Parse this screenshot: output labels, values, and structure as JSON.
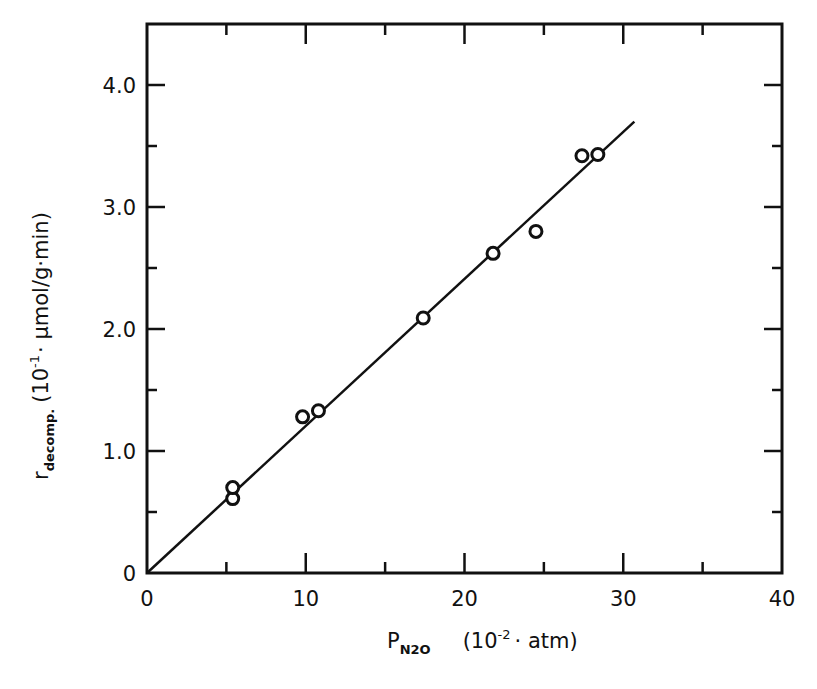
{
  "chart_data": {
    "type": "scatter",
    "title": "",
    "xlabel": "P_N2O (10^-2 · atm)",
    "ylabel": "r_decomp. (10^-1 · µmol/g·min)",
    "xlabel_parts": {
      "symbol": "P",
      "subscript": "N2O",
      "unit_pre": "(10",
      "unit_sup": "-2",
      "unit_post": "· atm)"
    },
    "ylabel_parts": {
      "symbol": "r",
      "subscript": "decomp.",
      "unit_pre": "(10",
      "unit_sup": "-1",
      "unit_post": "· µmol/g·min)"
    },
    "xlim": [
      0,
      40
    ],
    "ylim": [
      0,
      4.5
    ],
    "x_ticks": [
      0,
      10,
      20,
      30,
      40
    ],
    "x_tick_labels": [
      "0",
      "10",
      "20",
      "30",
      "40"
    ],
    "x_minor_ticks": [
      5,
      15,
      25,
      35
    ],
    "y_ticks": [
      0,
      1.0,
      2.0,
      3.0,
      4.0
    ],
    "y_tick_labels": [
      "0",
      "1.0",
      "2.0",
      "3.0",
      "4.0"
    ],
    "y_minor_ticks": [
      0.5,
      1.5,
      2.5,
      3.5
    ],
    "grid": false,
    "legend": null,
    "series": [
      {
        "name": "measured",
        "marker": "open-circle",
        "x": [
          5.4,
          5.4,
          9.8,
          10.8,
          17.4,
          21.8,
          24.5,
          27.4,
          28.4
        ],
        "y": [
          0.61,
          0.7,
          1.28,
          1.33,
          2.09,
          2.62,
          2.8,
          3.42,
          3.43
        ]
      },
      {
        "name": "linear fit",
        "style": "line",
        "x": [
          0,
          30.7
        ],
        "y": [
          0,
          3.7
        ]
      }
    ]
  }
}
